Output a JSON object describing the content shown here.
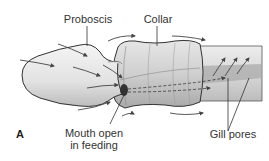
{
  "figure": {
    "panel_label": "A",
    "labels": {
      "proboscis": "Proboscis",
      "collar": "Collar",
      "mouth_line1": "Mouth open",
      "mouth_line2": "in feeding",
      "gill_pores": "Gill pores"
    },
    "colors": {
      "body_fill": "#e8e8e8",
      "body_shade": "#b8b8b8",
      "outline": "#333333",
      "arrow": "#444444",
      "channel": "#a8a8a8"
    }
  }
}
